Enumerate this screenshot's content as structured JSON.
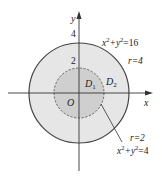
{
  "diagram": {
    "axes": {
      "x_label": "x",
      "y_label": "y",
      "origin_label": "O"
    },
    "ticks": {
      "y_tick_outer": "4",
      "y_tick_inner": "2"
    },
    "regions": {
      "inner_label_base": "D",
      "inner_label_sub": "1",
      "outer_label_base": "D",
      "outer_label_sub": "2"
    },
    "outer_circle": {
      "equation_base": "x",
      "equation_sup1": "2",
      "equation_mid": "+y",
      "equation_sup2": "2",
      "equation_rhs": "=16",
      "radius_label": "r=4",
      "fill": "#e6e6e6",
      "stroke": "#444444"
    },
    "inner_circle": {
      "equation_base": "x",
      "equation_sup1": "2",
      "equation_mid": "+y",
      "equation_sup2": "2",
      "equation_rhs": "=4",
      "radius_label": "r=2",
      "fill": "#cfcfcf",
      "stroke": "#555555"
    }
  }
}
